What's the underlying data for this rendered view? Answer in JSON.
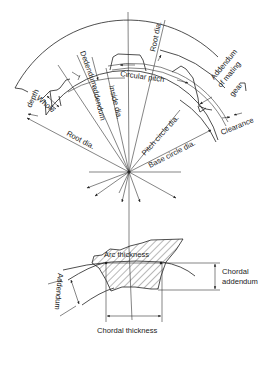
{
  "figure": {
    "type": "gear tooth nomenclature diagram",
    "line_color": "#222222",
    "background": "#ffffff"
  },
  "labels": {
    "root_dia_top": "Root dia.",
    "dedendum": "Dedendum",
    "addendum_top": "addendum",
    "inside_dia": "Inside dia.",
    "circular_pitch": "Circular pitch",
    "addendum_mating_1": "Addendum",
    "addendum_mating_2": "of mating",
    "addendum_mating_3": "gear",
    "whole_depth_1": "Whole",
    "whole_depth_2": "depth",
    "clearance": "Clearance",
    "root_dia_left": "Root dia.",
    "pitch_circle_dia": "Pitch circle dia.",
    "base_circle_dia": "Base circle dia.",
    "arc_thickness": "Arc thickness",
    "addendum_bottom": "Addendum",
    "chordal_addendum_1": "Chordal",
    "chordal_addendum_2": "addendum",
    "chordal_thickness": "Chordal thickness"
  }
}
